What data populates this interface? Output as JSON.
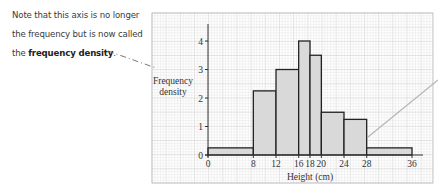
{
  "annotation": {
    "line1": "Note that this axis is no longer",
    "line2": "the frequency but is now called",
    "line3_prefix": "the ",
    "line3_bold": "frequency density",
    "line3_suffix": "."
  },
  "chart_data": {
    "type": "bar",
    "subtype": "histogram",
    "title": "",
    "xlabel": "Height (cm)",
    "ylabel": "Frequency density",
    "xlim": [
      0,
      36
    ],
    "ylim": [
      0,
      4
    ],
    "x_ticks": [
      0,
      8,
      12,
      16,
      18,
      20,
      24,
      28,
      36
    ],
    "y_ticks": [
      0,
      1,
      2,
      3,
      4
    ],
    "grid": true,
    "bins": [
      {
        "from": 0,
        "to": 8,
        "value": 0.25
      },
      {
        "from": 8,
        "to": 12,
        "value": 2.25
      },
      {
        "from": 12,
        "to": 16,
        "value": 3
      },
      {
        "from": 16,
        "to": 18,
        "value": 4
      },
      {
        "from": 18,
        "to": 20,
        "value": 3.5
      },
      {
        "from": 20,
        "to": 24,
        "value": 1.5
      },
      {
        "from": 24,
        "to": 28,
        "value": 1.25
      },
      {
        "from": 28,
        "to": 36,
        "value": 0.25
      }
    ],
    "colors": {
      "bar_fill": "#d9d9d9",
      "bar_stroke": "#222222",
      "grid_minor": "#e6e6e6",
      "grid_major": "#c8c8c8",
      "pointer": "#b5b5b5"
    }
  }
}
